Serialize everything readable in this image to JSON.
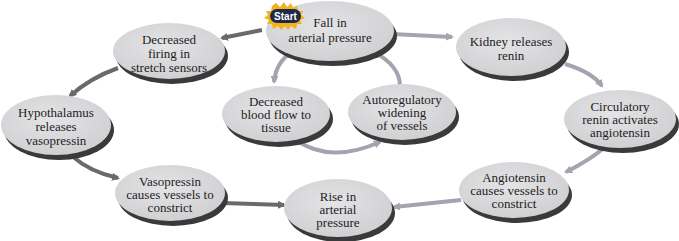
{
  "diagram": {
    "type": "cycle-flowchart",
    "start_label": "Start",
    "colors": {
      "node_fill": "#d8d8da",
      "node_shadow": "#3a3a3a",
      "arrow_dark": "#6a6a6a",
      "arrow_light": "#a8a2b0",
      "start_burst": "#f2b21c",
      "start_pill": "#1f2a4a"
    },
    "nodes": [
      {
        "id": "fall",
        "lines": [
          "Fall in",
          "arterial pressure"
        ]
      },
      {
        "id": "decreased_firing",
        "lines": [
          "Decreased",
          "firing in",
          "stretch sensors"
        ]
      },
      {
        "id": "hypothalamus",
        "lines": [
          "Hypothalamus",
          "releases",
          "vasopressin"
        ]
      },
      {
        "id": "vasopressin",
        "lines": [
          "Vasopressin",
          "causes vessels to",
          "constrict"
        ]
      },
      {
        "id": "rise",
        "lines": [
          "Rise in",
          "arterial",
          "pressure"
        ]
      },
      {
        "id": "decreased_blood",
        "lines": [
          "Decreased",
          "blood flow to",
          "tissue"
        ]
      },
      {
        "id": "autoregulatory",
        "lines": [
          "Autoregulatory",
          "widening",
          "of vessels"
        ]
      },
      {
        "id": "kidney",
        "lines": [
          "Kidney releases",
          "renin"
        ]
      },
      {
        "id": "circulatory",
        "lines": [
          "Circulatory",
          "renin activates",
          "angiotensin"
        ]
      },
      {
        "id": "angiotensin",
        "lines": [
          "Angiotensin",
          "causes vessels to",
          "constrict"
        ]
      }
    ],
    "edges": [
      {
        "from": "fall",
        "to": "decreased_firing"
      },
      {
        "from": "decreased_firing",
        "to": "hypothalamus"
      },
      {
        "from": "hypothalamus",
        "to": "vasopressin"
      },
      {
        "from": "vasopressin",
        "to": "rise"
      },
      {
        "from": "fall",
        "to": "decreased_blood"
      },
      {
        "from": "decreased_blood",
        "to": "autoregulatory"
      },
      {
        "from": "autoregulatory",
        "to": "fall"
      },
      {
        "from": "fall",
        "to": "kidney"
      },
      {
        "from": "kidney",
        "to": "circulatory"
      },
      {
        "from": "circulatory",
        "to": "angiotensin"
      },
      {
        "from": "angiotensin",
        "to": "rise"
      }
    ]
  }
}
